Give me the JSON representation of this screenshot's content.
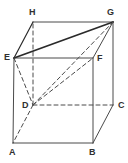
{
  "figure": {
    "name": "cuboid-diagram",
    "type": "geometric-solid",
    "solid": "rectangular-prism",
    "background_color": "#ffffff",
    "stroke_color": "#4a4a4a",
    "accent_stroke_color": "#2b2b2b",
    "label_color": "#303030",
    "canvas": {
      "width": 128,
      "height": 163
    }
  },
  "vertices": [
    {
      "id": "A",
      "label": "A",
      "x": 13,
      "y": 143,
      "label_x": 9,
      "label_y": 148,
      "hidden": false
    },
    {
      "id": "B",
      "label": "B",
      "x": 93,
      "y": 143,
      "label_x": 89,
      "label_y": 148,
      "hidden": false
    },
    {
      "id": "C",
      "label": "C",
      "x": 113,
      "y": 105,
      "label_x": 118,
      "label_y": 101,
      "hidden": false
    },
    {
      "id": "D",
      "label": "D",
      "x": 33,
      "y": 105,
      "label_x": 22,
      "label_y": 101,
      "hidden": true
    },
    {
      "id": "E",
      "label": "E",
      "x": 14,
      "y": 58,
      "label_x": 4,
      "label_y": 53,
      "hidden": false
    },
    {
      "id": "F",
      "label": "F",
      "x": 93,
      "y": 58,
      "label_x": 97,
      "label_y": 54,
      "hidden": false
    },
    {
      "id": "G",
      "label": "G",
      "x": 113,
      "y": 22,
      "label_x": 107,
      "label_y": 8,
      "hidden": false
    },
    {
      "id": "H",
      "label": "H",
      "x": 33,
      "y": 22,
      "label_x": 29,
      "label_y": 8,
      "hidden": false
    }
  ],
  "edges": [
    {
      "id": "AB",
      "from": "A",
      "to": "B",
      "style": "solid",
      "weight": 1,
      "role": "front-bottom"
    },
    {
      "id": "BF",
      "from": "B",
      "to": "F",
      "style": "solid",
      "weight": 1,
      "role": "front-right"
    },
    {
      "id": "FE",
      "from": "F",
      "to": "E",
      "style": "solid",
      "weight": 1,
      "role": "front-top"
    },
    {
      "id": "EA",
      "from": "E",
      "to": "A",
      "style": "solid",
      "weight": 1,
      "role": "front-left"
    },
    {
      "id": "HG",
      "from": "H",
      "to": "G",
      "style": "solid",
      "weight": 1,
      "role": "back-top"
    },
    {
      "id": "GC",
      "from": "G",
      "to": "C",
      "style": "solid",
      "weight": 1,
      "role": "back-right"
    },
    {
      "id": "EH",
      "from": "E",
      "to": "H",
      "style": "solid",
      "weight": 1.2,
      "role": "top-left-slant"
    },
    {
      "id": "FG",
      "from": "F",
      "to": "G",
      "style": "solid",
      "weight": 1,
      "role": "top-right-slant"
    },
    {
      "id": "BC",
      "from": "B",
      "to": "C",
      "style": "solid",
      "weight": 1,
      "role": "bottom-right-slant"
    },
    {
      "id": "DC",
      "from": "D",
      "to": "C",
      "style": "dashed",
      "weight": 1,
      "role": "hidden-bottom-back"
    },
    {
      "id": "DH",
      "from": "D",
      "to": "H",
      "style": "dashed",
      "weight": 1,
      "role": "hidden-back-left"
    },
    {
      "id": "DA",
      "from": "D",
      "to": "A",
      "style": "dashed",
      "weight": 1,
      "role": "hidden-bottom-left-slant"
    }
  ],
  "diagonals": [
    {
      "id": "EG",
      "from": "E",
      "to": "G",
      "style": "solid",
      "weight": 1.8,
      "role": "highlighted-face-diagonal"
    },
    {
      "id": "ED",
      "from": "E",
      "to": "D",
      "style": "dashed",
      "weight": 1,
      "role": "hidden-diagonal"
    },
    {
      "id": "DG",
      "from": "D",
      "to": "G",
      "style": "dashed",
      "weight": 1,
      "role": "hidden-space-diagonal"
    },
    {
      "id": "DF",
      "from": "D",
      "to": "F",
      "style": "dashed",
      "weight": 1,
      "role": "hidden-diagonal-to-F"
    }
  ]
}
